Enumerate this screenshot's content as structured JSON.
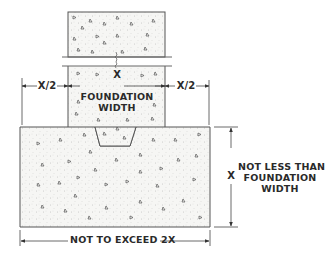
{
  "diagram": {
    "type": "foundation-footing-cross-section",
    "colors": {
      "line": "#555555",
      "concrete_fill": "#f6f6f4",
      "text": "#2a2a2a"
    },
    "labels": {
      "wall_width": "X",
      "left_offset": "X/2",
      "right_offset": "X/2",
      "foundation_width_line1": "FOUNDATION",
      "foundation_width_line2": "WIDTH",
      "footing_depth": "X",
      "depth_note_line1": "NOT LESS THAN",
      "depth_note_line2": "FOUNDATION",
      "depth_note_line3": "WIDTH",
      "footing_width_note": "NOT TO EXCEED 2X"
    },
    "components": [
      "foundation-wall",
      "break-lines",
      "keyway",
      "footing",
      "dimension-lines"
    ]
  }
}
